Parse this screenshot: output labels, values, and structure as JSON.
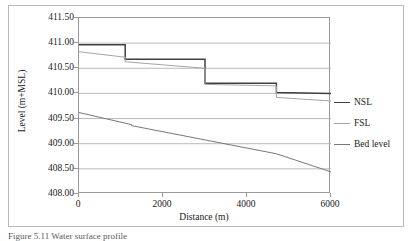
{
  "figure": {
    "caption": "Figure 5.11  Water surface profile"
  },
  "chart_data": {
    "type": "line",
    "title": "",
    "xlabel": "Distance (m)",
    "ylabel": "Level (m+MSL)",
    "xlim": [
      0,
      6000
    ],
    "ylim": [
      408.0,
      411.5
    ],
    "xticks": [
      0,
      2000,
      4000,
      6000
    ],
    "xtick_labels": [
      "0",
      "2000",
      "4000",
      "6000"
    ],
    "yticks": [
      408.0,
      408.5,
      409.0,
      409.5,
      410.0,
      410.5,
      411.0,
      411.5
    ],
    "ytick_labels": [
      "408.00",
      "408.50",
      "409.00",
      "409.50",
      "410.00",
      "410.50",
      "411.00",
      "411.50"
    ],
    "grid": "horizontal",
    "legend_position": "right-outside",
    "series": [
      {
        "name": "NSL",
        "color": "#404040",
        "style": "step",
        "x": [
          0,
          1100,
          1100,
          3000,
          3000,
          4700,
          4700,
          6000
        ],
        "y": [
          410.97,
          410.97,
          410.68,
          410.68,
          410.2,
          410.2,
          410.02,
          410.0
        ]
      },
      {
        "name": "FSL",
        "color": "#a5a5a5",
        "style": "step-sloped",
        "x": [
          0,
          1100,
          1100,
          3000,
          3000,
          4700,
          4700,
          6000
        ],
        "y": [
          410.83,
          410.72,
          410.63,
          410.5,
          410.18,
          410.15,
          409.92,
          409.85
        ]
      },
      {
        "name": "Bed level",
        "color": "#777777",
        "style": "line",
        "x": [
          0,
          1250,
          1250,
          4700,
          6000
        ],
        "y": [
          409.62,
          409.38,
          409.36,
          408.8,
          408.44
        ]
      }
    ]
  },
  "legend": {
    "items": [
      {
        "label": "NSL",
        "color": "#404040"
      },
      {
        "label": "FSL",
        "color": "#a5a5a5"
      },
      {
        "label": "Bed level",
        "color": "#777777"
      }
    ]
  }
}
